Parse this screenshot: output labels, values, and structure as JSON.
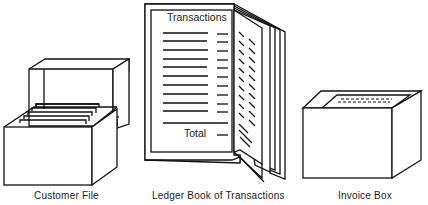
{
  "diagram": {
    "items": [
      {
        "id": "customer-file",
        "label": "Customer File"
      },
      {
        "id": "ledger-book",
        "label": "Ledger Book of Transactions",
        "page_heading": "Transactions",
        "page_footer": "Total"
      },
      {
        "id": "invoice-box",
        "label": "Invoice Box"
      }
    ]
  }
}
